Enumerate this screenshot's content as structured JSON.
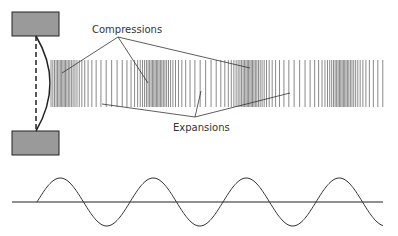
{
  "labels": {
    "compressions": "Compressions",
    "expansions": "Expansions"
  },
  "colors": {
    "box_fill": "#9a9a9a",
    "box_stroke": "#222222",
    "line": "#333333",
    "bar": "#8a8a8a",
    "wave": "#333333"
  },
  "source": {
    "top_block": {
      "x": 12,
      "y": 12,
      "w": 47,
      "h": 24
    },
    "bottom_block": {
      "x": 12,
      "y": 131,
      "w": 47,
      "h": 24
    }
  },
  "pressure_band": {
    "x_start": 51,
    "x_end": 383,
    "y_top": 60,
    "y_bottom": 107,
    "compression_centers": [
      62,
      150,
      252,
      342
    ],
    "expansion_centers": [
      106,
      200,
      297
    ]
  },
  "wave": {
    "x_start": 37,
    "x_end": 383,
    "baseline_y": 202,
    "amplitude": 24,
    "period": 93,
    "axis_x_start": 12,
    "axis_x_end": 383
  }
}
